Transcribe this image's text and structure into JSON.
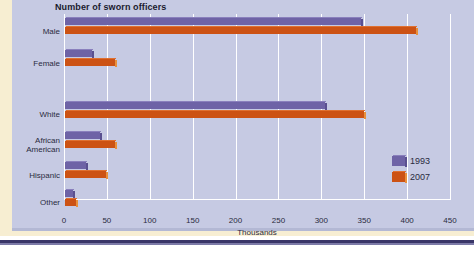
{
  "chart_data": {
    "type": "bar",
    "orientation": "horizontal",
    "title": "Number of sworn officers",
    "xlabel": "Thousands",
    "ylabel": "",
    "xlim": [
      0,
      450
    ],
    "xticks": [
      "0",
      "50",
      "100",
      "150",
      "200",
      "250",
      "300",
      "350",
      "400",
      "450"
    ],
    "grid": true,
    "legend_position": "right",
    "categories": [
      "Male",
      "Female",
      "White",
      "African\nAmerican",
      "Hispanic",
      "Other"
    ],
    "series": [
      {
        "name": "1993",
        "color": "#6e63a6",
        "values": [
          345,
          32,
          303,
          41,
          25,
          9
        ]
      },
      {
        "name": "2007",
        "color": "#cc5214",
        "values": [
          409,
          58,
          349,
          58,
          48,
          13
        ]
      }
    ],
    "groups": [
      {
        "label": "Male",
        "v1993": 345,
        "v2007": 409
      },
      {
        "label": "Female",
        "v1993": 32,
        "v2007": 58
      },
      {
        "label": "White",
        "v1993": 303,
        "v2007": 349
      },
      {
        "label": "African\nAmerican",
        "v1993": 41,
        "v2007": 58
      },
      {
        "label": "Hispanic",
        "v1993": 25,
        "v2007": 48
      },
      {
        "label": "Other",
        "v1993": 9,
        "v2007": 13
      }
    ]
  },
  "legend": {
    "items": [
      {
        "label": "1993"
      },
      {
        "label": "2007"
      }
    ]
  },
  "colors": {
    "panel_background": "#c6cae3",
    "page_background": "#f7eed2",
    "series_1993": "#6e63a6",
    "series_2007": "#cc5214",
    "rule": "#3a3668"
  }
}
